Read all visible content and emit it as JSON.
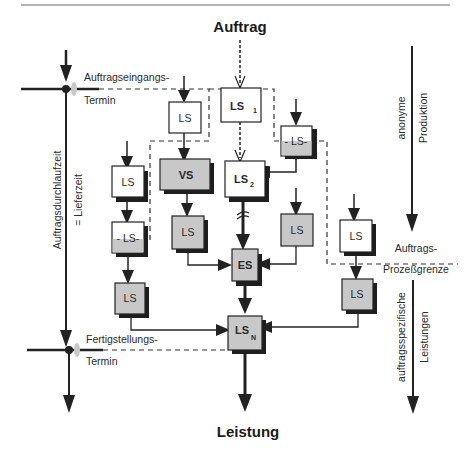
{
  "title_top": "Auftrag",
  "title_bottom": "Leistung",
  "left_axis": {
    "start_label_line1": "Auftragseingangs-",
    "start_label_line2": "Termin",
    "end_label_line1": "Fertigstellungs-",
    "end_label_line2": "Termin",
    "vertical_label": "Auftragsdurchlaufzeit",
    "vertical_sublabel": "= Lieferzeit"
  },
  "right_axis": {
    "upper_label_line1": "anonyme",
    "upper_label_line2": "Produktion",
    "boundary_label_line1": "Auftrags-",
    "boundary_label_line2": "Prozeßgrenze",
    "lower_label_line1": "auftragsspezifische",
    "lower_label_line2": "Leistungen"
  },
  "nodes": {
    "ls_top_left": {
      "label": "LS",
      "fill": "white"
    },
    "ls1": {
      "label": "LS",
      "sub": "1",
      "fill": "white"
    },
    "ls_dashed_right": {
      "label": "- LS-",
      "fill": "split"
    },
    "ls_left_1": {
      "label": "LS",
      "fill": "white"
    },
    "vs": {
      "label": "VS",
      "fill": "gray"
    },
    "ls2": {
      "label": "LS",
      "sub": "2",
      "fill": "white"
    },
    "ls_left_dashed": {
      "label": "- LS-",
      "fill": "split"
    },
    "ls_below_vs": {
      "label": "LS",
      "fill": "gray"
    },
    "ls_right_gray": {
      "label": "LS",
      "fill": "gray"
    },
    "ls_far_right_white": {
      "label": "LS",
      "fill": "white"
    },
    "es": {
      "label": "ES",
      "fill": "gray"
    },
    "ls_left_bottom": {
      "label": "LS",
      "fill": "gray"
    },
    "ls_far_right_gray": {
      "label": "LS",
      "fill": "gray"
    },
    "lsn": {
      "label": "LS",
      "sub": "N",
      "fill": "gray"
    }
  },
  "colors": {
    "gray_fill": "#c8c8c8",
    "shadow": "#1e1e1e",
    "line": "#222222",
    "marker_glow": "#c9c9c9"
  }
}
